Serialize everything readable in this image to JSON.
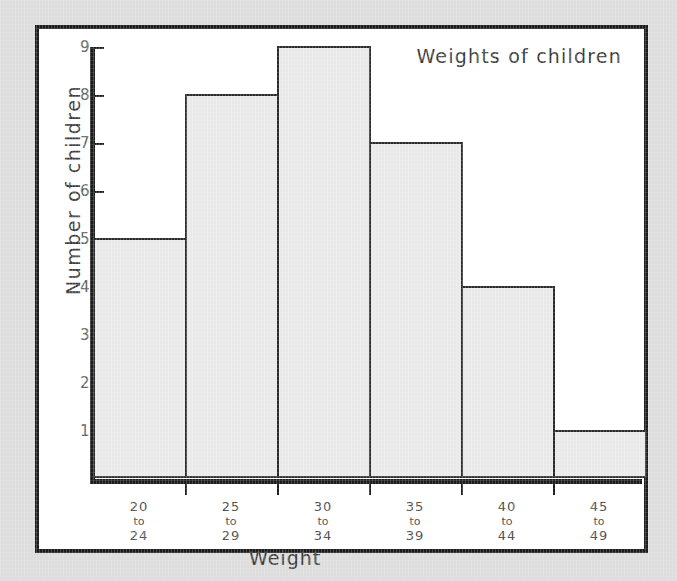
{
  "chart_data": {
    "type": "bar",
    "title": "Weights of children",
    "xlabel": "Weight",
    "ylabel": "Number of children",
    "categories": [
      "20 to 24",
      "25 to 29",
      "30 to 34",
      "35 to 39",
      "40 to 44",
      "45 to 49"
    ],
    "category_lines": [
      {
        "from": "20",
        "to": "to",
        "upper": "24"
      },
      {
        "from": "25",
        "to": "to",
        "upper": "29"
      },
      {
        "from": "30",
        "to": "to",
        "upper": "34"
      },
      {
        "from": "35",
        "to": "to",
        "upper": "39"
      },
      {
        "from": "40",
        "to": "to",
        "upper": "44"
      },
      {
        "from": "45",
        "to": "to",
        "upper": "49"
      }
    ],
    "values": [
      5,
      8,
      9,
      7,
      4,
      1
    ],
    "ylim": [
      0,
      9
    ],
    "ytick_labels": [
      "1",
      "2",
      "3",
      "4",
      "5",
      "6",
      "7",
      "8",
      "9"
    ],
    "yticks": [
      1,
      2,
      3,
      4,
      5,
      6,
      7,
      8,
      9
    ],
    "grid": false,
    "legend": "none",
    "bar_fill_color": "#e9e9e9",
    "bar_edge_color": "#2b2b2b",
    "axis_color": "#1c1c1c",
    "text_color": "#3a3a3a",
    "plot_background": "#ffffff",
    "page_background": "#dcdcdc"
  }
}
